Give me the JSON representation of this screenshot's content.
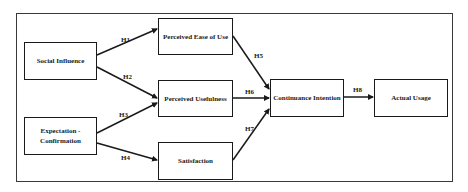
{
  "diagram": {
    "nodes": [
      {
        "id": "social_influence",
        "label": "Social Influence"
      },
      {
        "id": "expectation_confirmation",
        "label": "Expectation -\nConfirmation"
      },
      {
        "id": "perceived_ease_of_use",
        "label": "Perceived Ease of Use"
      },
      {
        "id": "perceived_usefulness",
        "label": "Perceived Usefulness"
      },
      {
        "id": "satisfaction",
        "label": "Satisfaction"
      },
      {
        "id": "continuance_intention",
        "label": "Continuance Intention"
      },
      {
        "id": "actual_usage",
        "label": "Actual Usage"
      }
    ],
    "edges": [
      {
        "label": "H1",
        "from": "Social Influence",
        "to": "Perceived Ease of Use"
      },
      {
        "label": "H2",
        "from": "Social Influence",
        "to": "Perceived Usefulness"
      },
      {
        "label": "H3",
        "from": "Expectation - Confirmation",
        "to": "Perceived Usefulness"
      },
      {
        "label": "H4",
        "from": "Expectation - Confirmation",
        "to": "Satisfaction"
      },
      {
        "label": "H5",
        "from": "Perceived Ease of Use",
        "to": "Continuance Intention"
      },
      {
        "label": "H6",
        "from": "Perceived Usefulness",
        "to": "Continuance Intention"
      },
      {
        "label": "H7",
        "from": "Satisfaction",
        "to": "Continuance Intention"
      },
      {
        "label": "H8",
        "from": "Continuance Intention",
        "to": "Actual Usage"
      }
    ],
    "colors": {
      "stroke": "#1a1a1a",
      "background": "#ffffff",
      "frame": "#3a3a3a"
    }
  }
}
